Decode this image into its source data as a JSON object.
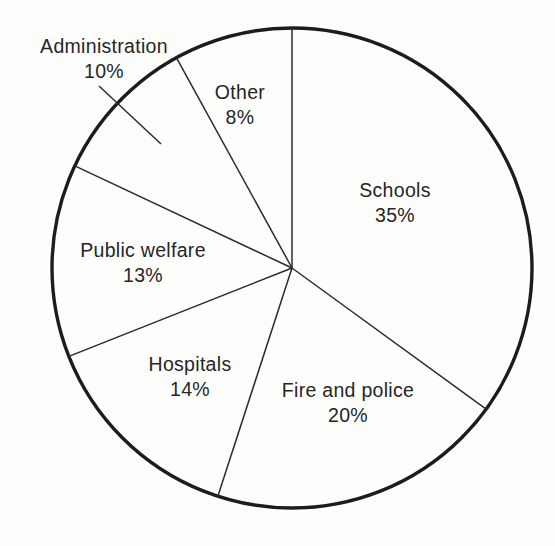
{
  "chart_data": {
    "type": "pie",
    "title": "",
    "subtitle": "",
    "xlabel": "",
    "ylabel": "",
    "legend_position": "none",
    "grid": false,
    "value_unit": "%",
    "total": 100,
    "start_angle_deg": 0,
    "direction": "clockwise",
    "categories": [
      "Schools",
      "Fire and police",
      "Hospitals",
      "Public welfare",
      "Administration",
      "Other"
    ],
    "values": [
      35,
      20,
      14,
      13,
      10,
      8
    ],
    "slices": [
      {
        "name": "Schools",
        "value": 35,
        "value_label": "35%",
        "start_pct": 0,
        "end_pct": 35,
        "label_placement": "inside"
      },
      {
        "name": "Fire and police",
        "value": 20,
        "value_label": "20%",
        "start_pct": 35,
        "end_pct": 55,
        "label_placement": "inside"
      },
      {
        "name": "Hospitals",
        "value": 14,
        "value_label": "14%",
        "start_pct": 55,
        "end_pct": 69,
        "label_placement": "inside"
      },
      {
        "name": "Public welfare",
        "value": 13,
        "value_label": "13%",
        "start_pct": 69,
        "end_pct": 82,
        "label_placement": "inside"
      },
      {
        "name": "Administration",
        "value": 10,
        "value_label": "10%",
        "start_pct": 82,
        "end_pct": 92,
        "label_placement": "outside-leader"
      },
      {
        "name": "Other",
        "value": 8,
        "value_label": "8%",
        "start_pct": 92,
        "end_pct": 100,
        "label_placement": "inside"
      }
    ],
    "colors": {
      "background": "#fdfdfc",
      "slice_fill": "#fdfdfc",
      "outline": "#1c1c1c",
      "divider": "#2b2b2b",
      "text": "#262626"
    }
  }
}
